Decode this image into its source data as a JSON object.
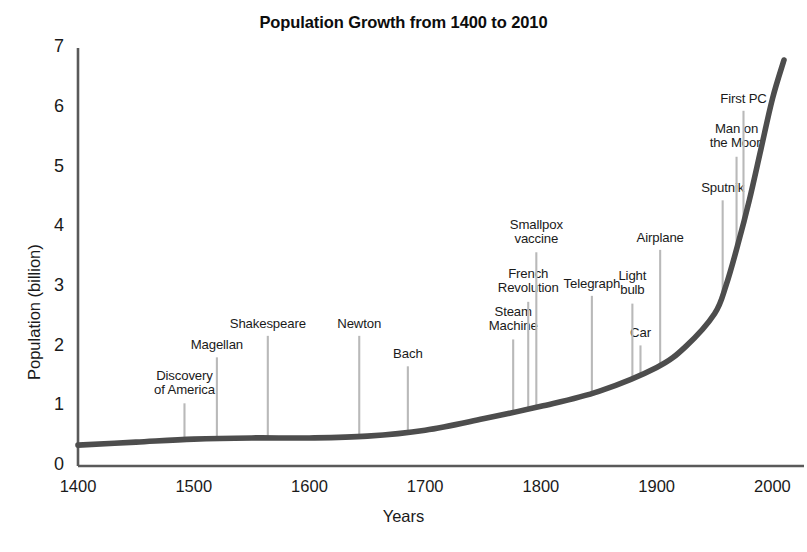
{
  "chart_data": {
    "type": "line",
    "title": "Population Growth from 1400 to 2010",
    "xlabel": "Years",
    "ylabel": "Population (billion)",
    "xlim": [
      1400,
      2010
    ],
    "ylim": [
      0,
      7
    ],
    "grid": false,
    "legend": "none",
    "line_color": "#4d4d4d",
    "annotation_line_color": "#b9b9b9",
    "axis_color": "#5a5a5a",
    "xticks": [
      1400,
      1500,
      1600,
      1700,
      1800,
      1900,
      2000
    ],
    "yticks": [
      0,
      1,
      2,
      3,
      4,
      5,
      6,
      7
    ],
    "x": [
      1400,
      1450,
      1500,
      1550,
      1600,
      1650,
      1700,
      1750,
      1800,
      1850,
      1900,
      1925,
      1950,
      1960,
      1970,
      1980,
      1990,
      2000,
      2010
    ],
    "values": [
      0.35,
      0.4,
      0.45,
      0.47,
      0.47,
      0.5,
      0.6,
      0.79,
      1.0,
      1.25,
      1.65,
      2.0,
      2.55,
      3.03,
      3.7,
      4.45,
      5.3,
      6.15,
      6.8
    ],
    "series": [
      {
        "name": "World population",
        "values": [
          0.35,
          0.4,
          0.45,
          0.47,
          0.47,
          0.5,
          0.6,
          0.79,
          1.0,
          1.25,
          1.65,
          2.0,
          2.55,
          3.03,
          3.7,
          4.45,
          5.3,
          6.15,
          6.8
        ]
      }
    ],
    "annotations": [
      {
        "label": "Discovery\nof America",
        "year": 1492,
        "top_value": 1.05,
        "label_lines": [
          "Discovery",
          "of America"
        ]
      },
      {
        "label": "Magellan",
        "year": 1520,
        "top_value": 1.82,
        "label_lines": [
          "Magellan"
        ]
      },
      {
        "label": "Shakespeare",
        "year": 1564,
        "top_value": 2.18,
        "label_lines": [
          "Shakespeare"
        ]
      },
      {
        "label": "Newton",
        "year": 1643,
        "top_value": 2.18,
        "label_lines": [
          "Newton"
        ]
      },
      {
        "label": "Bach",
        "year": 1685,
        "top_value": 1.67,
        "label_lines": [
          "Bach"
        ]
      },
      {
        "label": "Steam\nMachine",
        "year": 1776,
        "top_value": 2.12,
        "label_lines": [
          "Steam",
          "Machine"
        ]
      },
      {
        "label": "French\nRevolution",
        "year": 1789,
        "top_value": 2.75,
        "label_lines": [
          "French",
          "Revolution"
        ]
      },
      {
        "label": "Smallpox\nvaccine",
        "year": 1796,
        "top_value": 3.58,
        "label_lines": [
          "Smallpox",
          "vaccine"
        ]
      },
      {
        "label": "Telegraph",
        "year": 1844,
        "top_value": 2.85,
        "label_lines": [
          "Telegraph"
        ]
      },
      {
        "label": "Car",
        "year": 1886,
        "top_value": 2.02,
        "label_lines": [
          "Car"
        ]
      },
      {
        "label": "Light\nbulb",
        "year": 1879,
        "top_value": 2.72,
        "label_lines": [
          "Light",
          "bulb"
        ]
      },
      {
        "label": "Airplane",
        "year": 1903,
        "top_value": 3.62,
        "label_lines": [
          "Airplane"
        ]
      },
      {
        "label": "Sputnik",
        "year": 1957,
        "top_value": 4.45,
        "label_lines": [
          "Sputnik"
        ]
      },
      {
        "label": "Man on\nthe Moon",
        "year": 1969,
        "top_value": 5.18,
        "label_lines": [
          "Man on",
          "the Moon"
        ]
      },
      {
        "label": "First PC",
        "year": 1975,
        "top_value": 5.95,
        "label_lines": [
          "First PC"
        ]
      }
    ]
  }
}
